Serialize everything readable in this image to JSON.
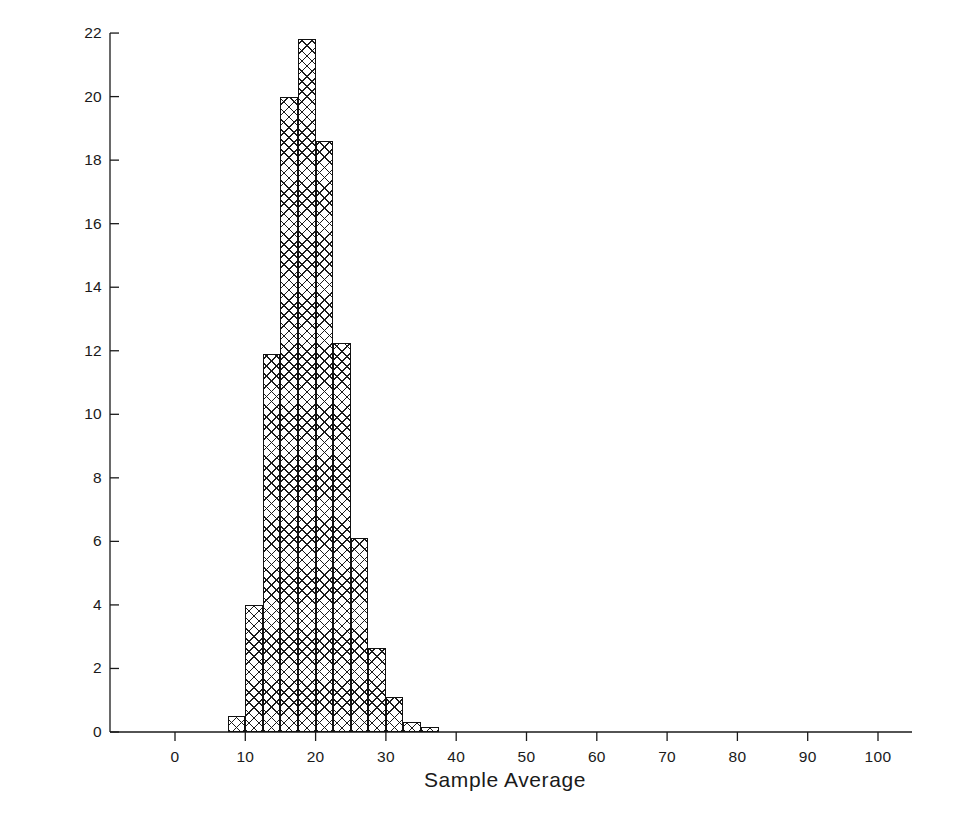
{
  "chart_data": {
    "type": "bar",
    "title": "",
    "subtitle": "",
    "xlabel": "Sample Average",
    "ylabel": "Percent of Samples",
    "xlim": [
      -5,
      108
    ],
    "ylim": [
      0,
      22
    ],
    "grid": false,
    "legend": null,
    "xticks": [
      0,
      10,
      20,
      30,
      40,
      50,
      60,
      70,
      80,
      90,
      100
    ],
    "xtick_labels": [
      "0",
      "10",
      "20",
      "30",
      "40",
      "50",
      "60",
      "70",
      "80",
      "90",
      "100"
    ],
    "yticks": [
      0,
      2,
      4,
      6,
      8,
      10,
      12,
      14,
      16,
      18,
      20,
      22
    ],
    "ytick_labels": [
      "0",
      "2",
      "4",
      "6",
      "8",
      "10",
      "12",
      "14",
      "16",
      "18",
      "20",
      "22"
    ],
    "bin_width": 2.5,
    "bin_starts": [
      7.5,
      10.0,
      12.5,
      15.0,
      17.5,
      20.0,
      22.5,
      25.0,
      27.5,
      30.0,
      32.5,
      35.0
    ],
    "categories": [
      "7.5-10",
      "10-12.5",
      "12.5-15",
      "15-17.5",
      "17.5-20",
      "20-22.5",
      "22.5-25",
      "25-27.5",
      "27.5-30",
      "30-32.5",
      "32.5-35",
      "35-37.5"
    ],
    "values": [
      0.5,
      4.0,
      11.9,
      20.0,
      21.8,
      18.6,
      12.25,
      6.1,
      2.65,
      1.1,
      0.3,
      0.15
    ],
    "bar_style": {
      "fill": "#ffffff",
      "edge": "#111111",
      "hatch": "crosshatch-xx"
    }
  },
  "axis_titles": {
    "x": "Sample Average",
    "y": "Percent of Samples"
  },
  "colors": {
    "background": "#ffffff",
    "ink": "#1a1a1a",
    "bar_edge": "#111111",
    "hatch": "#1b1b1b"
  }
}
